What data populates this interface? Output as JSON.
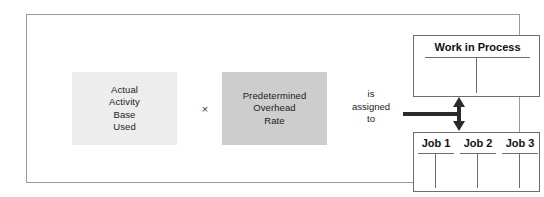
{
  "diagram": {
    "operands": [
      {
        "name": "actual-activity-base-used",
        "lines": [
          "Actual",
          "Activity",
          "Base",
          "Used"
        ],
        "fill": "#ededed"
      },
      {
        "name": "predetermined-overhead-rate",
        "lines": [
          "Predetermined",
          "Overhead",
          "Rate"
        ],
        "fill": "#cdcdcd"
      }
    ],
    "operator": "×",
    "connector_label": [
      "is",
      "assigned",
      "to"
    ],
    "connector_color": "#2b2b2b",
    "accounts": {
      "work_in_process": {
        "title": "Work in Process"
      },
      "jobs": [
        {
          "title": "Job 1"
        },
        {
          "title": "Job 2"
        },
        {
          "title": "Job 3"
        }
      ]
    },
    "frame_color": "#9a9a9a",
    "account_border_color": "#6d6d6d"
  }
}
